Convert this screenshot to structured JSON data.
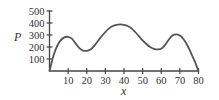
{
  "chart_data": {
    "type": "line",
    "title": "",
    "xlabel": "x",
    "ylabel": "P",
    "xlim": [
      0,
      80
    ],
    "ylim": [
      0,
      500
    ],
    "xticks": [
      10,
      20,
      30,
      40,
      50,
      60,
      70,
      80
    ],
    "yticks": [
      100,
      200,
      300,
      400,
      500
    ],
    "grid": false,
    "legend": null,
    "series": [
      {
        "name": "P",
        "color": "#555555",
        "x": [
          0,
          2,
          4,
          6,
          8,
          10,
          12,
          14,
          16,
          18,
          20,
          22,
          24,
          26,
          28,
          30,
          32,
          34,
          36,
          38,
          40,
          42,
          44,
          46,
          48,
          50,
          52,
          54,
          56,
          58,
          60,
          62,
          64,
          66,
          68,
          70,
          72,
          74,
          76,
          78,
          80
        ],
        "y": [
          0,
          120,
          205,
          255,
          280,
          285,
          270,
          230,
          190,
          170,
          168,
          180,
          210,
          250,
          290,
          325,
          355,
          375,
          385,
          388,
          385,
          375,
          355,
          325,
          290,
          255,
          225,
          200,
          185,
          180,
          185,
          215,
          260,
          295,
          305,
          295,
          265,
          215,
          150,
          80,
          0
        ]
      }
    ]
  },
  "labels": {
    "xlabel": "x",
    "ylabel": "P",
    "xticks": [
      "10",
      "20",
      "30",
      "40",
      "50",
      "60",
      "70",
      "80"
    ],
    "yticks": [
      "100",
      "200",
      "300",
      "400",
      "500"
    ]
  }
}
